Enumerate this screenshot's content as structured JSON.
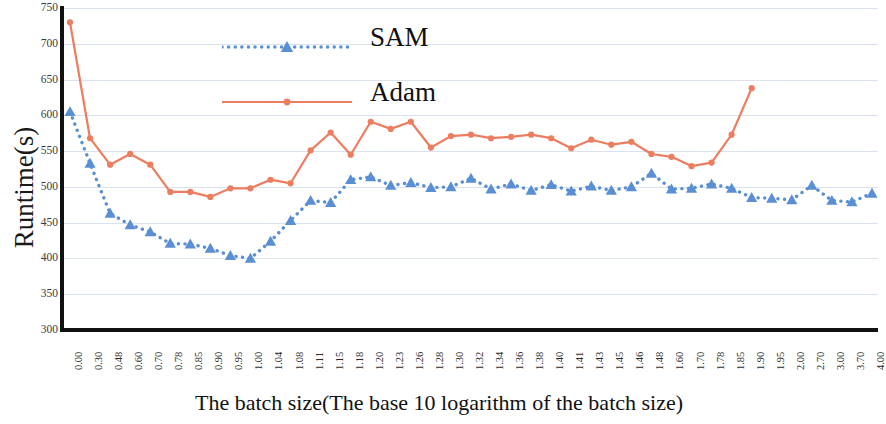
{
  "chart_data": {
    "type": "line",
    "title": "",
    "xlabel": "The batch size(The base 10 logarithm of the batch size)",
    "ylabel": "Runtime(s)",
    "ylim": [
      300,
      750
    ],
    "yticks": [
      750,
      700,
      650,
      600,
      550,
      500,
      450,
      400,
      350,
      300
    ],
    "grid": true,
    "legend_position": "top-center-left",
    "categories": [
      "0.00",
      "0.30",
      "0.48",
      "0.60",
      "0.70",
      "0.78",
      "0.85",
      "0.90",
      "0.95",
      "1.00",
      "1.04",
      "1.08",
      "1.11",
      "1.15",
      "1.18",
      "1.20",
      "1.23",
      "1.26",
      "1.28",
      "1.30",
      "1.32",
      "1.34",
      "1.36",
      "1.38",
      "1.40",
      "1.41",
      "1.43",
      "1.45",
      "1.46",
      "1.48",
      "1.60",
      "1.70",
      "1.78",
      "1.85",
      "1.90",
      "1.95",
      "2.00",
      "2.70",
      "3.00",
      "3.70",
      "4.00"
    ],
    "series": [
      {
        "name": "SAM",
        "color": "#5B8FD4",
        "line_style": "dotted",
        "marker": "triangle",
        "values": [
          605,
          533,
          463,
          447,
          437,
          421,
          420,
          414,
          404,
          400,
          424,
          453,
          481,
          478,
          510,
          514,
          502,
          506,
          499,
          500,
          512,
          497,
          504,
          495,
          503,
          494,
          501,
          495,
          500,
          519,
          497,
          498,
          504,
          498,
          485,
          484,
          482,
          502,
          481,
          479,
          491
        ]
      },
      {
        "name": "Adam",
        "color": "#ED7D5F",
        "line_style": "solid",
        "marker": "circle",
        "values": [
          730,
          568,
          531,
          546,
          531,
          493,
          493,
          486,
          498,
          498,
          510,
          505,
          551,
          576,
          545,
          591,
          581,
          591,
          555,
          571,
          573,
          568,
          570,
          573,
          568,
          554,
          566,
          559,
          563,
          546,
          542,
          529,
          534,
          573,
          638,
          0,
          0,
          0,
          0,
          0,
          0
        ]
      }
    ]
  },
  "legend": {
    "items": [
      {
        "label": "SAM",
        "color": "#5B8FD4",
        "style": "dotted",
        "marker": "triangle"
      },
      {
        "label": "Adam",
        "color": "#ED7D5F",
        "style": "solid",
        "marker": "circle"
      }
    ]
  },
  "axes": {
    "y_title": "Runtime(s)",
    "x_title": "The batch size(The base 10 logarithm of the batch size)"
  }
}
